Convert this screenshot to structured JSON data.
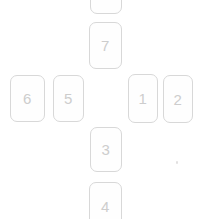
{
  "spread": {
    "description": "cross layout of numbered card slots",
    "cards": [
      {
        "id": "top-partial",
        "label": ""
      },
      {
        "id": "slot-7",
        "label": "7"
      },
      {
        "id": "slot-6",
        "label": "6"
      },
      {
        "id": "slot-5",
        "label": "5"
      },
      {
        "id": "slot-1",
        "label": "1"
      },
      {
        "id": "slot-2",
        "label": "2"
      },
      {
        "id": "slot-3",
        "label": "3"
      },
      {
        "id": "slot-4",
        "label": "4"
      }
    ]
  },
  "colors": {
    "background": "#ffffff",
    "card_border": "#d8d8d8",
    "card_background": "#fefefe",
    "card_number": "#cdcdcd"
  }
}
